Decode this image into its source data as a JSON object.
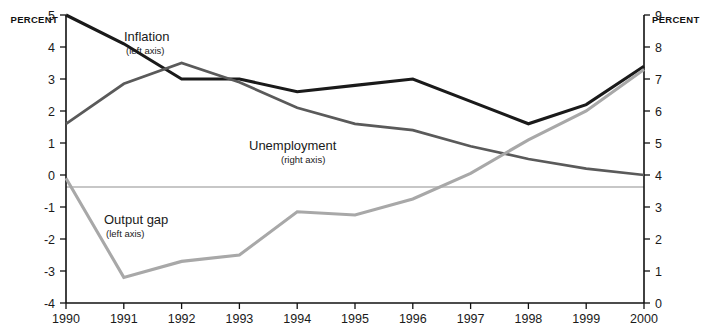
{
  "labels": {
    "left_axis_title": "PERCENT",
    "right_axis_title": "PERCENT"
  },
  "series_labels": {
    "inflation": {
      "name": "Inflation",
      "axis_note": "(left axis)"
    },
    "unemployment": {
      "name": "Unemployment",
      "axis_note": "(right axis)"
    },
    "output_gap": {
      "name": "Output gap",
      "axis_note": "(left axis)"
    }
  },
  "colors": {
    "inflation": "#1a1a1a",
    "unemployment": "#5a5a5a",
    "output_gap": "#a8a8a8",
    "axis": "#111111",
    "zero_line": "#8f8f8f"
  },
  "chart_data": {
    "type": "line",
    "title": "",
    "subtitle": "",
    "xlabel": "",
    "ylabel": "PERCENT",
    "y2label": "PERCENT",
    "grid": false,
    "legend": "inline-annotations",
    "x": [
      1990,
      1991,
      1992,
      1993,
      1994,
      1995,
      1996,
      1997,
      1998,
      1999,
      2000
    ],
    "categories": [
      "1990",
      "1991",
      "1992",
      "1993",
      "1994",
      "1995",
      "1996",
      "1997",
      "1998",
      "1999",
      "2000"
    ],
    "xlim": [
      1990,
      2000
    ],
    "ylim": [
      -4,
      5
    ],
    "y2lim": [
      0,
      9
    ],
    "yticks": [
      -4,
      -3,
      -2,
      -1,
      0,
      1,
      2,
      3,
      4,
      5
    ],
    "ytick_labels": [
      "-4",
      "-3",
      "-2",
      "-1",
      "0",
      "1",
      "2",
      "3",
      "4",
      "5"
    ],
    "y2ticks": [
      0,
      1,
      2,
      3,
      4,
      5,
      6,
      7,
      8,
      9
    ],
    "y2tick_labels": [
      "0",
      "1",
      "2",
      "3",
      "4",
      "5",
      "6",
      "7",
      "8",
      "9"
    ],
    "series": [
      {
        "name": "Inflation",
        "axis": "left",
        "color": "#1a1a1a",
        "values": [
          5.0,
          4.1,
          3.0,
          3.0,
          2.6,
          2.8,
          3.0,
          2.3,
          1.6,
          2.2,
          3.4
        ]
      },
      {
        "name": "Unemployment",
        "axis": "right",
        "color": "#5a5a5a",
        "values": [
          5.6,
          6.85,
          7.5,
          6.9,
          6.1,
          5.6,
          5.4,
          4.9,
          4.5,
          4.2,
          4.0
        ]
      },
      {
        "name": "Output gap",
        "axis": "left",
        "color": "#a8a8a8",
        "values": [
          -0.1,
          -3.2,
          -2.7,
          -2.5,
          -1.15,
          -1.25,
          -0.75,
          0.05,
          1.1,
          2.0,
          3.3
        ]
      }
    ]
  }
}
